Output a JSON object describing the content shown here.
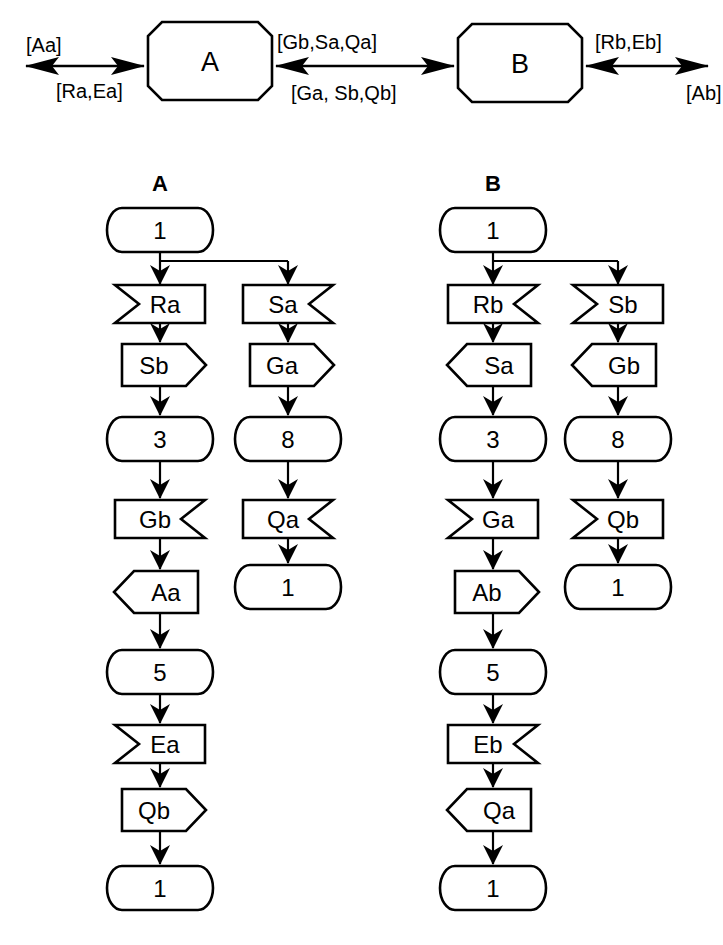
{
  "top_diagram": {
    "entity_a": {
      "label": "A"
    },
    "entity_b": {
      "label": "B"
    },
    "left_channel": {
      "above_label": "[Aa]",
      "below_label": "[Ra,Ea]"
    },
    "middle_channel": {
      "above_label": "[Gb,Sa,Qa]",
      "below_label": "[Ga, Sb,Qb]"
    },
    "right_channel": {
      "above_label": "[Rb,Eb]",
      "below_label": "[Ab]"
    }
  },
  "process_a": {
    "title": "A",
    "initial_state": "1",
    "left_branch": [
      {
        "label": "Ra",
        "type": "input-from-left"
      },
      {
        "label": "Sb",
        "type": "output-to-right"
      },
      {
        "label": "3",
        "type": "state"
      },
      {
        "label": "Gb",
        "type": "input-from-right"
      },
      {
        "label": "Aa",
        "type": "output-to-left"
      },
      {
        "label": "5",
        "type": "state"
      },
      {
        "label": "Ea",
        "type": "input-from-left"
      },
      {
        "label": "Qb",
        "type": "output-to-right"
      },
      {
        "label": "1",
        "type": "state"
      }
    ],
    "right_branch": [
      {
        "label": "Sa",
        "type": "input-from-right"
      },
      {
        "label": "Ga",
        "type": "output-to-right"
      },
      {
        "label": "8",
        "type": "state"
      },
      {
        "label": "Qa",
        "type": "input-from-right"
      },
      {
        "label": "1",
        "type": "state"
      }
    ]
  },
  "process_b": {
    "title": "B",
    "initial_state": "1",
    "left_branch": [
      {
        "label": "Rb",
        "type": "input-from-right"
      },
      {
        "label": "Sa",
        "type": "output-to-left"
      },
      {
        "label": "3",
        "type": "state"
      },
      {
        "label": "Ga",
        "type": "input-from-left"
      },
      {
        "label": "Ab",
        "type": "output-to-right"
      },
      {
        "label": "5",
        "type": "state"
      },
      {
        "label": "Eb",
        "type": "input-from-right"
      },
      {
        "label": "Qa",
        "type": "output-to-left"
      },
      {
        "label": "1",
        "type": "state"
      }
    ],
    "right_branch": [
      {
        "label": "Sb",
        "type": "input-from-left"
      },
      {
        "label": "Gb",
        "type": "output-to-left"
      },
      {
        "label": "8",
        "type": "state"
      },
      {
        "label": "Qb",
        "type": "input-from-left"
      },
      {
        "label": "1",
        "type": "state"
      }
    ]
  }
}
